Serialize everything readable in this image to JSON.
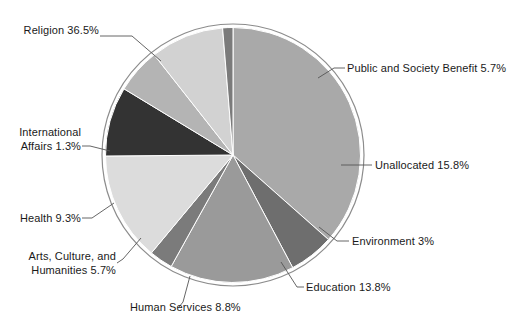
{
  "chart_data": {
    "type": "pie",
    "title": "",
    "subtitle": "",
    "xlabel": "",
    "ylabel": "",
    "legend_position": "callout-labels",
    "grid": false,
    "total_percent": 99.9,
    "start_angle_deg": -90,
    "direction": "clockwise",
    "categories": [
      "Religion",
      "Public and Society Benefit",
      "Unallocated",
      "Environment",
      "Education",
      "Human Services",
      "Arts, Culture, and Humanities",
      "Health",
      "International Affairs"
    ],
    "values": [
      36.5,
      5.7,
      15.8,
      3,
      13.8,
      8.8,
      5.7,
      9.3,
      1.3
    ],
    "slices": [
      {
        "name": "Religion",
        "value": 36.5,
        "display": "36.5%",
        "color": "#a9a9a9"
      },
      {
        "name": "Public and Society Benefit",
        "value": 5.7,
        "display": "5.7%",
        "color": "#6e6e6e"
      },
      {
        "name": "Unallocated",
        "value": 15.8,
        "display": "15.8%",
        "color": "#9a9a9a"
      },
      {
        "name": "Environment",
        "value": 3,
        "display": "3%",
        "color": "#7b7b7b"
      },
      {
        "name": "Education",
        "value": 13.8,
        "display": "13.8%",
        "color": "#dcdcdc"
      },
      {
        "name": "Human Services",
        "value": 8.8,
        "display": "8.8%",
        "color": "#333333"
      },
      {
        "name": "Arts, Culture, and Humanities",
        "value": 5.7,
        "display": "5.7%",
        "color": "#b4b4b4"
      },
      {
        "name": "Health",
        "value": 9.3,
        "display": "9.3%",
        "color": "#d2d2d2"
      },
      {
        "name": "International Affairs",
        "value": 1.3,
        "display": "1.3%",
        "color": "#7b7b7b"
      }
    ]
  },
  "labels": {
    "religion": "Religion 36.5%",
    "public_society_benefit": "Public and Society Benefit 5.7%",
    "unallocated": "Unallocated 15.8%",
    "environment": "Environment 3%",
    "education": "Education 13.8%",
    "human_services": "Human Services 8.8%",
    "arts_line1": "Arts, Culture, and",
    "arts_line2": "Humanities 5.7%",
    "health": "Health 9.3%",
    "international_line1": "International",
    "international_line2": "Affairs 1.3%"
  },
  "style": {
    "background": "#ffffff",
    "outline": "#8c8c8c",
    "leader_line": "#555555",
    "text": "#1a1a1a"
  }
}
